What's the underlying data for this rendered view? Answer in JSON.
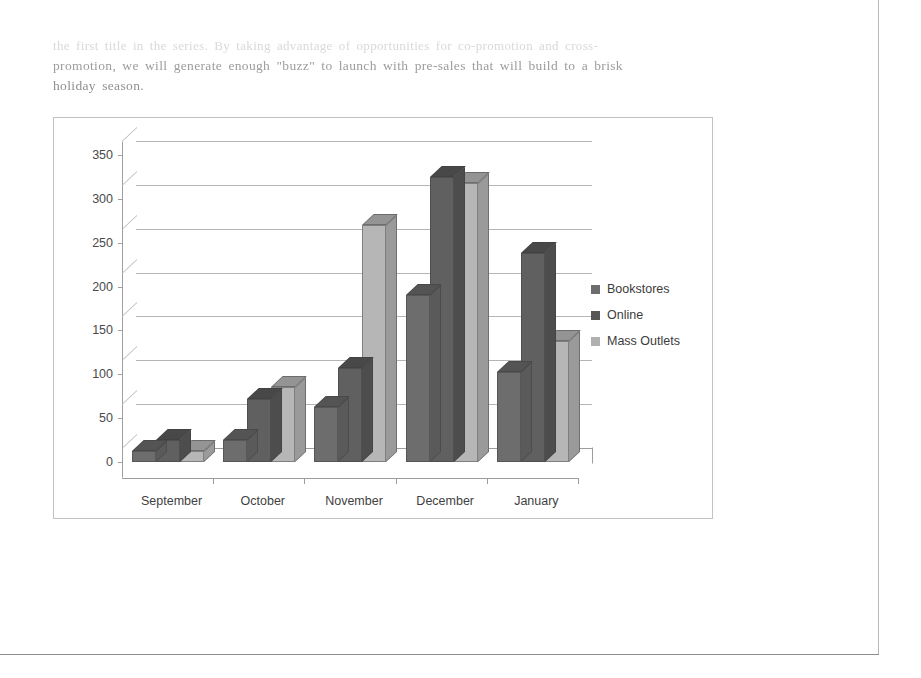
{
  "document": {
    "body_text": [
      "the first title in the series. By taking advantage of opportunities for co-promotion and cross-",
      "promotion, we will generate enough \"buzz\" to launch with pre-sales that will build to a brisk",
      "holiday season."
    ]
  },
  "chart_data": {
    "type": "bar",
    "style": "3d-clustered-column",
    "title": "",
    "xlabel": "",
    "ylabel": "",
    "categories": [
      "September",
      "October",
      "November",
      "December",
      "January"
    ],
    "series": [
      {
        "name": "Bookstores",
        "color": "#6d6d6d",
        "values": [
          12,
          25,
          63,
          190,
          103
        ]
      },
      {
        "name": "Online",
        "color": "#565656",
        "values": [
          25,
          72,
          107,
          325,
          238
        ]
      },
      {
        "name": "Mass Outlets",
        "color": "#b0b0b0",
        "values": [
          12,
          85,
          270,
          318,
          138
        ]
      }
    ],
    "yticks": [
      0,
      50,
      100,
      150,
      200,
      250,
      300,
      350
    ],
    "ylim": [
      0,
      365
    ],
    "grid": true,
    "legend_position": "right",
    "legend_entries": [
      "Bookstores",
      "Online",
      "Mass Outlets"
    ]
  }
}
